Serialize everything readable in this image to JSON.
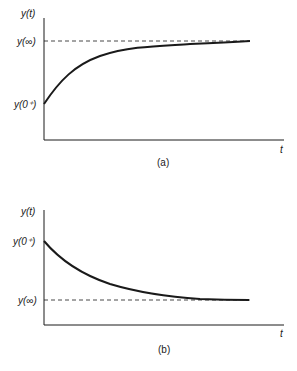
{
  "figure": {
    "panels": [
      {
        "id": "a",
        "caption": "(a)",
        "y_axis_label": "y(t)",
        "x_axis_label": "t",
        "y_inf_label": "y(∞)",
        "y_0_label": "y(0⁺)",
        "description": "Exponential rise from y(0+) approaching y(∞) asymptote (dashed)"
      },
      {
        "id": "b",
        "caption": "(b)",
        "y_axis_label": "y(t)",
        "x_axis_label": "t",
        "y_inf_label": "y(∞)",
        "y_0_label": "y(0⁺)",
        "description": "Exponential decay from y(0+) approaching y(∞) asymptote (dashed)"
      }
    ],
    "colors": {
      "ink": "#1a1a1a",
      "background": "#ffffff"
    }
  }
}
